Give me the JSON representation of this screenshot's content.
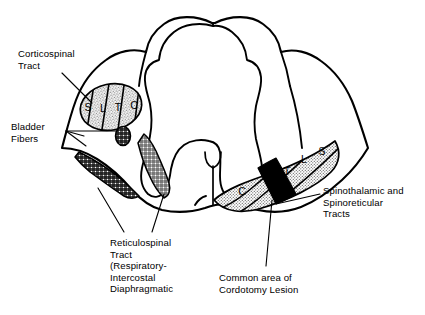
{
  "figure": {
    "colors": {
      "outline": "#000000",
      "background": "#ffffff",
      "lesion_fill": "#000000",
      "stipple_fill": "#d8d8d8",
      "crosshatch_fill": "#2b2b2b"
    }
  },
  "annotations": [
    {
      "id": "corticospinal",
      "name": "corticospinal-tract-label",
      "text": "Corticospinal\nTract",
      "x": 18,
      "y": 48
    },
    {
      "id": "bladder",
      "name": "bladder-fibers-label",
      "text": "Bladder\nFibers",
      "x": 11,
      "y": 121
    },
    {
      "id": "reticulospinal",
      "name": "reticulospinal-tract-label",
      "text": "Reticulospinal\nTract\n(Respiratory-\nIntercostal\nDiaphragmatic",
      "x": 110,
      "y": 237
    },
    {
      "id": "spinothalamic",
      "name": "spinothalamic-tracts-label",
      "text": "Spinothalamic and\nSpinoreticular\nTracts",
      "x": 323,
      "y": 185
    },
    {
      "id": "cordotomy",
      "name": "cordotomy-lesion-label",
      "text": "Common area of\nCordotomy Lesion",
      "x": 219,
      "y": 272
    }
  ],
  "corticospinal_tract": {
    "name": "corticospinal-tract-region",
    "segments": [
      {
        "label": "S",
        "x": 88,
        "y": 108
      },
      {
        "label": "L",
        "x": 103,
        "y": 109
      },
      {
        "label": "T",
        "x": 118,
        "y": 108
      },
      {
        "label": "C",
        "x": 134,
        "y": 106
      }
    ]
  },
  "spinothalamic_tract": {
    "name": "spinothalamic-tract-region",
    "segments": [
      {
        "label": "S",
        "x": 322,
        "y": 152
      },
      {
        "label": "L",
        "x": 304,
        "y": 159
      },
      {
        "label": "T",
        "x": 287,
        "y": 172
      },
      {
        "label": "C",
        "x": 242,
        "y": 192
      }
    ]
  },
  "lesion": {
    "name": "cordotomy-lesion-region",
    "label": "Common area of Cordotomy Lesion"
  },
  "bladder_fibers": {
    "name": "bladder-fibers-region",
    "targets": [
      "oval-bladder-fiber-spot",
      "anterolateral-bladder-fiber-band"
    ]
  },
  "reticulospinal": {
    "name": "reticulospinal-tract-region"
  }
}
